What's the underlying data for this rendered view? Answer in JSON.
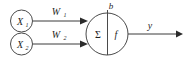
{
  "diagram": {
    "background_color": "#ffffff",
    "stroke_color": "#4a4a4a",
    "text_color": "#1f1f1f",
    "inputs": [
      {
        "label": "X",
        "subscript": "1"
      },
      {
        "label": "X",
        "subscript": "2"
      }
    ],
    "weights": [
      {
        "label": "W",
        "subscript": "1"
      },
      {
        "label": "W",
        "subscript": "2"
      }
    ],
    "bias": {
      "label": "b"
    },
    "body": {
      "sum_label": "Σ",
      "activation_label": "f"
    },
    "output": {
      "label": "y"
    }
  }
}
